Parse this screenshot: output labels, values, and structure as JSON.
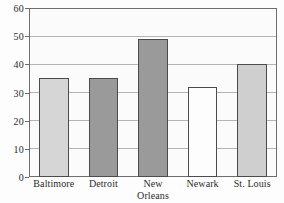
{
  "chart_data": {
    "type": "bar",
    "title": "",
    "subtitle": "",
    "xlabel": "",
    "ylabel": "",
    "categories": [
      "Baltimore",
      "Detroit",
      "New Orleans",
      "Newark",
      "St. Louis"
    ],
    "category_lines": [
      [
        "Baltimore"
      ],
      [
        "Detroit"
      ],
      [
        "New",
        "Orleans"
      ],
      [
        "Newark"
      ],
      [
        "St. Louis"
      ]
    ],
    "values": [
      35,
      35,
      49,
      32,
      40
    ],
    "ylim": [
      0,
      60
    ],
    "y_ticks": [
      0,
      10,
      20,
      30,
      40,
      50,
      60
    ],
    "y_tick_labels": [
      "0",
      "10",
      "20",
      "30",
      "40",
      "50",
      "60"
    ],
    "grid": true,
    "grid_axis": "y",
    "legend": false,
    "legend_position": "none",
    "bar_colors": [
      "#d6d6d6",
      "#9a9a9a",
      "#9a9a9a",
      "#fdfdfd",
      "#cfcfcf"
    ],
    "bar_edge_color": "#4c4c4c",
    "plot_background": "#fbfbfb",
    "frame_color": "#6e6e6e",
    "gridline_color": "#b4b4b4",
    "text_color": "#2b2b2b",
    "annotations": []
  }
}
